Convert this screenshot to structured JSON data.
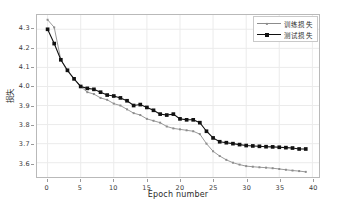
{
  "chart_data": {
    "type": "line",
    "title": "",
    "xlabel": "Epoch number",
    "ylabel": "损失",
    "xlim": [
      -1.6,
      41.0
    ],
    "ylim": [
      3.525,
      4.375
    ],
    "xticks": [
      0,
      5,
      10,
      15,
      20,
      25,
      30,
      35,
      40
    ],
    "xticklabels": [
      "0",
      "5",
      "10",
      "15",
      "20",
      "25",
      "30",
      "35",
      "40"
    ],
    "yticks": [
      3.6,
      3.7,
      3.8,
      3.9,
      4.0,
      4.1,
      4.2,
      4.3
    ],
    "yticklabels": [
      "3.6",
      "3.7",
      "3.8",
      "3.9",
      "4.0",
      "4.1",
      "4.2",
      "4.3"
    ],
    "grid": true,
    "grid_color": "#ebebeb",
    "legend_position": "upper right",
    "x": [
      0,
      1,
      2,
      3,
      4,
      5,
      6,
      7,
      8,
      9,
      10,
      11,
      12,
      13,
      14,
      15,
      16,
      17,
      18,
      19,
      20,
      21,
      22,
      23,
      24,
      25,
      26,
      27,
      28,
      29,
      30,
      31,
      32,
      33,
      34,
      35,
      36,
      37,
      38,
      39
    ],
    "series": [
      {
        "name": "训练损失",
        "color": "#8c8c8c",
        "marker": "small-dot",
        "values": [
          4.35,
          4.31,
          4.14,
          4.08,
          4.04,
          4.0,
          3.97,
          3.96,
          3.94,
          3.93,
          3.91,
          3.9,
          3.88,
          3.86,
          3.85,
          3.83,
          3.82,
          3.81,
          3.79,
          3.78,
          3.775,
          3.77,
          3.765,
          3.75,
          3.7,
          3.66,
          3.635,
          3.615,
          3.6,
          3.59,
          3.582,
          3.579,
          3.576,
          3.574,
          3.571,
          3.567,
          3.563,
          3.559,
          3.556,
          3.552
        ]
      },
      {
        "name": "测试损失",
        "color": "#111111",
        "marker": "square",
        "values": [
          4.3,
          4.225,
          4.14,
          4.085,
          4.04,
          4.0,
          3.99,
          3.985,
          3.97,
          3.955,
          3.95,
          3.94,
          3.925,
          3.9,
          3.905,
          3.89,
          3.875,
          3.855,
          3.85,
          3.855,
          3.83,
          3.825,
          3.825,
          3.81,
          3.765,
          3.73,
          3.71,
          3.705,
          3.7,
          3.695,
          3.69,
          3.688,
          3.686,
          3.684,
          3.683,
          3.681,
          3.679,
          3.677,
          3.672,
          3.672
        ]
      }
    ]
  }
}
